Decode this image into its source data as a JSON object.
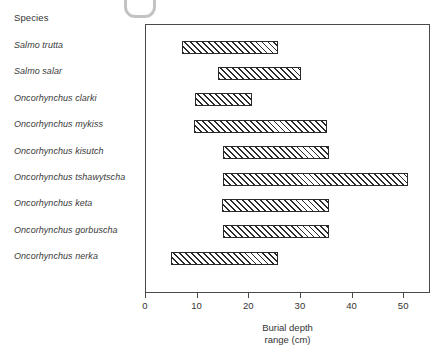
{
  "figure": {
    "species_header": "Species",
    "artifact": "u-shaped-scan-mark"
  },
  "chart_data": {
    "type": "bar",
    "orientation": "horizontal",
    "subtype": "range-bar",
    "title": "",
    "xlabel_line1": "Burial depth",
    "xlabel_line2": "range (cm)",
    "ylabel": "Species",
    "xlim": [
      0,
      55.2
    ],
    "xticks": [
      0,
      10,
      20,
      30,
      40,
      50
    ],
    "xticklabels": [
      "0",
      "10",
      "20",
      "30",
      "40",
      "50"
    ],
    "grid": false,
    "legend": false,
    "categories": [
      "Salmo trutta",
      "Salmo salar",
      "Oncorhynchus clarki",
      "Oncorhynchus mykiss",
      "Oncorhynchus kisutch",
      "Oncorhynchus tshawytscha",
      "Oncorhynchus keta",
      "Oncorhynchus gorbuscha",
      "Oncorhynchus nerka"
    ],
    "ranges": [
      {
        "species": "Salmo trutta",
        "start": 7,
        "end": 25.5
      },
      {
        "species": "Salmo salar",
        "start": 14,
        "end": 30
      },
      {
        "species": "Oncorhynchus clarki",
        "start": 9.5,
        "end": 20.5
      },
      {
        "species": "Oncorhynchus mykiss",
        "start": 9.3,
        "end": 35
      },
      {
        "species": "Oncorhynchus kisutch",
        "start": 15,
        "end": 35.5
      },
      {
        "species": "Oncorhynchus tshawytscha",
        "start": 15,
        "end": 50.8
      },
      {
        "species": "Oncorhynchus keta",
        "start": 14.8,
        "end": 35.5
      },
      {
        "species": "Oncorhynchus gorbuscha",
        "start": 15,
        "end": 35.5
      },
      {
        "species": "Oncorhynchus nerka",
        "start": 4.8,
        "end": 25.5
      }
    ],
    "bar_fill": "diagonal-hatch",
    "bar_edge_color": "#2a2a2a",
    "bar_face_color": "#ffffff"
  }
}
